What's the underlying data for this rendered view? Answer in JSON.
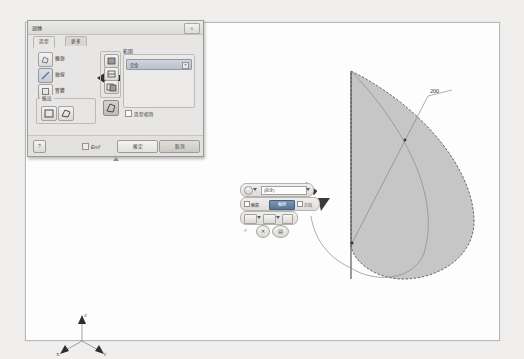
{
  "app": {
    "background_color": "#f0efee",
    "canvas_color": "#fdfdfd"
  },
  "dialog": {
    "title": "迴轉",
    "close_label": "✕",
    "tabs": [
      {
        "label": "造型",
        "active": true
      },
      {
        "label": "更多",
        "active": false
      }
    ],
    "shape_options": [
      {
        "label": "輪廓",
        "icon": "profile-icon",
        "selected": false
      },
      {
        "label": "軸線",
        "icon": "axis-icon",
        "selected": true
      },
      {
        "label": "實體",
        "icon": "solid-icon",
        "selected": false
      }
    ],
    "output_group": {
      "legend": "輸出",
      "buttons": [
        {
          "icon": "solid-output-icon"
        },
        {
          "icon": "surface-output-icon"
        }
      ]
    },
    "boolean_buttons": [
      {
        "icon": "join-icon"
      },
      {
        "icon": "cut-icon"
      },
      {
        "icon": "intersect-icon"
      },
      {
        "icon": "new-solid-icon",
        "selected": true
      }
    ],
    "extent_group": {
      "legend": "範圍",
      "combo_value": "完全",
      "combo_arrow": "▼",
      "checkbox": {
        "label": "造型相符",
        "checked": false
      }
    },
    "footer": {
      "help_label": "?",
      "checkbox": {
        "label": "Emf",
        "checked": true
      },
      "ok_label": "確定",
      "cancel_label": "取消"
    }
  },
  "mini_toolbar": {
    "row1": {
      "field_value": "(完全)",
      "dropdown_arrow": "▶"
    },
    "row2": {
      "checkbox_label": "輪廓",
      "toggle_label": "軸線",
      "toggle_active": true,
      "extra_label": "方向"
    },
    "row3": {
      "button_count": 3
    },
    "row4": {
      "ok": "✓",
      "cancel": "✕",
      "options": "▤"
    }
  },
  "geometry": {
    "dimension_label": "200",
    "fill_color": "#c6c6c6",
    "outline_color": "#555555",
    "arrow_color": "#3a3a3a"
  },
  "axis_triad": {
    "x_label": "X",
    "y_label": "Y",
    "z_label": "Z"
  }
}
